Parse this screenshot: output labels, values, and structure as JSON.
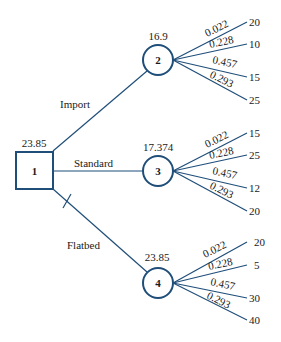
{
  "diagram": {
    "type": "decision-tree",
    "colors": {
      "line": "#1f4e79",
      "text": "#1a1a1a",
      "background": "#ffffff"
    },
    "decision_node": {
      "id": "1",
      "value": "23.85",
      "shape": "square"
    },
    "alternatives": [
      {
        "label": "Import",
        "pruned": false,
        "chance_node": {
          "id": "2",
          "value": "16.9"
        },
        "outcomes": [
          {
            "probability": "0.022",
            "value": "20"
          },
          {
            "probability": "0.228",
            "value": "10"
          },
          {
            "probability": "0.457",
            "value": "15"
          },
          {
            "probability": "0.293",
            "value": "25"
          }
        ]
      },
      {
        "label": "Standard",
        "pruned": false,
        "chance_node": {
          "id": "3",
          "value": "17.374"
        },
        "outcomes": [
          {
            "probability": "0.022",
            "value": "15"
          },
          {
            "probability": "0.228",
            "value": "25"
          },
          {
            "probability": "0.457",
            "value": "12"
          },
          {
            "probability": "0.293",
            "value": "20"
          }
        ]
      },
      {
        "label": "Flatbed",
        "pruned": true,
        "chance_node": {
          "id": "4",
          "value": "23.85"
        },
        "outcomes": [
          {
            "probability": "0.022",
            "value": "20"
          },
          {
            "probability": "0.228",
            "value": "5"
          },
          {
            "probability": "0.457",
            "value": "30"
          },
          {
            "probability": "0.293",
            "value": "40"
          }
        ]
      }
    ]
  }
}
